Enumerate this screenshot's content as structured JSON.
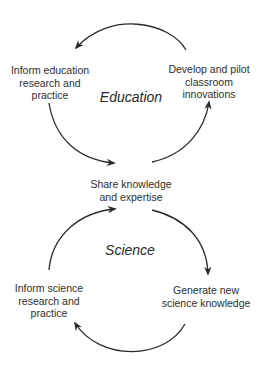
{
  "diagram": {
    "type": "double-cycle",
    "cycles": [
      {
        "title": "Education",
        "nodes": [
          {
            "id": "inform_education",
            "lines": [
              "Inform education",
              "research and",
              "practice"
            ]
          },
          {
            "id": "develop_pilot",
            "lines": [
              "Develop and pilot",
              "classroom",
              "innovations"
            ]
          }
        ]
      },
      {
        "title": "Science",
        "nodes": [
          {
            "id": "inform_science",
            "lines": [
              "Inform science",
              "research and",
              "practice"
            ]
          },
          {
            "id": "generate_new",
            "lines": [
              "Generate new",
              "science knowledge"
            ]
          }
        ]
      }
    ],
    "shared_node": {
      "id": "share_knowledge",
      "lines": [
        "Share knowledge",
        "and expertise"
      ]
    },
    "edges": [
      {
        "from": "develop_pilot",
        "to": "inform_education"
      },
      {
        "from": "inform_education",
        "to": "share_knowledge"
      },
      {
        "from": "share_knowledge",
        "to": "develop_pilot"
      },
      {
        "from": "share_knowledge",
        "to": "generate_new"
      },
      {
        "from": "generate_new",
        "to": "inform_science"
      },
      {
        "from": "inform_science",
        "to": "share_knowledge"
      }
    ],
    "colors": {
      "stroke": "#2a2a2a",
      "text": "#2e2e2e",
      "background": "#ffffff"
    }
  }
}
